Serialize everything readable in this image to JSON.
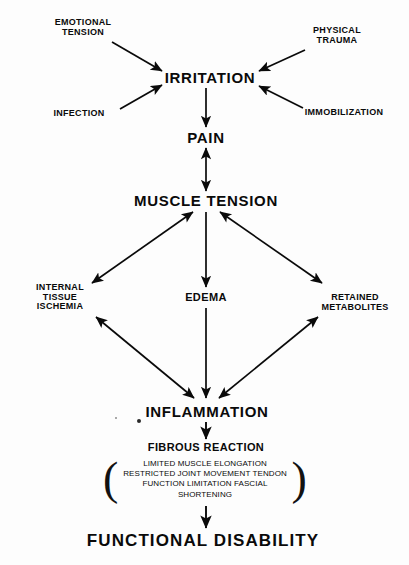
{
  "diagram": {
    "background_color": "#fdfdfd",
    "ink_color": "#0a0a0a",
    "nodes": {
      "emotional_tension": {
        "line1": "EMOTIONAL",
        "line2": "TENSION"
      },
      "physical_trauma": {
        "line1": "PHYSICAL",
        "line2": "TRAUMA"
      },
      "infection": {
        "label": "INFECTION"
      },
      "immobilization": {
        "label": "IMMOBILIZATION"
      },
      "irritation": {
        "label": "IRRITATION"
      },
      "pain": {
        "label": "PAIN"
      },
      "muscle_tension": {
        "label": "MUSCLE TENSION"
      },
      "internal_tissue_ischemia": {
        "line1": "INTERNAL",
        "line2": "TISSUE",
        "line3": "ISCHEMIA"
      },
      "edema": {
        "label": "EDEMA"
      },
      "retained_metabolites": {
        "line1": "RETAINED",
        "line2": "METABOLITES"
      },
      "inflammation": {
        "label": "INFLAMMATION"
      },
      "fibrous_reaction": {
        "label": "FIBROUS REACTION"
      },
      "fibrous_effects": {
        "open_paren": "(",
        "close_paren": ")",
        "items": [
          "LIMITED MUSCLE ELONGATION",
          "RESTRICTED JOINT MOVEMENT",
          "TENDON FUNCTION LIMITATION",
          "FASCIAL SHORTENING"
        ]
      },
      "functional_disability": {
        "label": "FUNCTIONAL DISABILITY"
      }
    },
    "edges": [
      {
        "from": "emotional_tension",
        "to": "irritation",
        "style": "single-arrow"
      },
      {
        "from": "infection",
        "to": "irritation",
        "style": "single-arrow"
      },
      {
        "from": "physical_trauma",
        "to": "irritation",
        "style": "single-arrow"
      },
      {
        "from": "immobilization",
        "to": "irritation",
        "style": "single-arrow"
      },
      {
        "from": "irritation",
        "to": "pain",
        "style": "single-arrow"
      },
      {
        "from": "pain",
        "to": "muscle_tension",
        "style": "double-arrow"
      },
      {
        "from": "muscle_tension",
        "to": "internal_tissue_ischemia",
        "style": "double-arrow"
      },
      {
        "from": "muscle_tension",
        "to": "edema",
        "style": "single-arrow"
      },
      {
        "from": "muscle_tension",
        "to": "retained_metabolites",
        "style": "double-arrow"
      },
      {
        "from": "internal_tissue_ischemia",
        "to": "inflammation",
        "style": "double-arrow"
      },
      {
        "from": "edema",
        "to": "inflammation",
        "style": "single-arrow"
      },
      {
        "from": "retained_metabolites",
        "to": "inflammation",
        "style": "double-arrow"
      },
      {
        "from": "inflammation",
        "to": "fibrous_reaction",
        "style": "single-arrow"
      },
      {
        "from": "fibrous_effects",
        "to": "functional_disability",
        "style": "single-arrow"
      }
    ]
  }
}
